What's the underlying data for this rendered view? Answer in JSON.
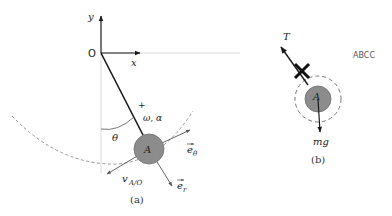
{
  "figure": {
    "panel_a": {
      "caption": "(a)",
      "origin_label": "O",
      "x_axis_label": "x",
      "y_axis_label": "y",
      "angle_label": "θ",
      "sign_label": "+",
      "omega_alpha_label": "ω, α",
      "mass_label": "A",
      "e_theta_label": "e",
      "e_theta_sub": "θ",
      "e_r_label": "e",
      "e_r_sub": "r",
      "velocity_label": "v",
      "velocity_sub": "A/O"
    },
    "panel_b": {
      "caption": "(b)",
      "tension_label": "T",
      "mass_label": "A",
      "weight_label": "mg",
      "stray_text": "ABCC"
    },
    "colors": {
      "mass_fill": "#8c8c8c",
      "mass_stroke": "#6e6e6e",
      "rod": "#1a1a1a",
      "guide": "#c8c8c8",
      "dashed": "#8a8a8a",
      "vector": "#555555"
    }
  }
}
